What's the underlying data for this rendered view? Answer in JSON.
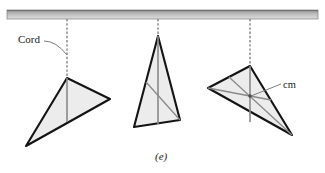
{
  "figure": {
    "caption": "(e)",
    "labels": {
      "cord": "Cord",
      "center_of_mass": "cm"
    },
    "colors": {
      "background": "#ffffff",
      "ceiling_fill_top": "#9d9d9d",
      "ceiling_fill_bottom": "#d8d8d8",
      "ceiling_edge": "#7a7a7a",
      "cord": "#8c8c8c",
      "plate_fill": "#ececec",
      "plate_edge": "#141414",
      "median_line": "#8a8a8a",
      "leader_line": "#6f6f6f",
      "text": "#1a1a1a"
    },
    "ceiling": {
      "name": "ceiling-bar",
      "x": 7,
      "y": 10,
      "width": 311,
      "height": 9
    },
    "cords": [
      {
        "name": "cord-1",
        "x": 67,
        "y_top": 19,
        "y_bottom": 79
      },
      {
        "name": "cord-2",
        "x": 158,
        "y_top": 19,
        "y_bottom": 37
      },
      {
        "name": "cord-3",
        "x": 250,
        "y_top": 19,
        "y_bottom": 67
      }
    ],
    "plates": [
      {
        "name": "triangular-plate-1",
        "pivot": [
          67,
          78
        ],
        "vertices": [
          [
            67,
            78
          ],
          [
            110,
            99
          ],
          [
            26,
            146
          ]
        ],
        "plumb_lines": [
          [
            [
              67,
              78
            ],
            [
              67,
              122
            ]
          ]
        ],
        "medians": []
      },
      {
        "name": "triangular-plate-2",
        "pivot": [
          158,
          36
        ],
        "vertices": [
          [
            158,
            36
          ],
          [
            180,
            120
          ],
          [
            134,
            127
          ]
        ],
        "plumb_lines": [
          [
            [
              158,
              36
            ],
            [
              158,
              124
            ]
          ]
        ],
        "medians": [
          [
            [
              180,
              120
            ],
            [
              146,
              82
            ]
          ]
        ]
      },
      {
        "name": "triangular-plate-3",
        "pivot": [
          250,
          66
        ],
        "vertices": [
          [
            250,
            66
          ],
          [
            292,
            135
          ],
          [
            208,
            88
          ]
        ],
        "plumb_lines": [
          [
            [
              250,
              66
            ],
            [
              250,
              122
            ]
          ]
        ],
        "medians": [
          [
            [
              292,
              135
            ],
            [
              229,
              77
            ]
          ],
          [
            [
              208,
              88
            ],
            [
              271,
              100
            ]
          ]
        ],
        "centroid": [
          250,
          96
        ]
      }
    ],
    "leaders": {
      "cord_leader": {
        "name": "cord-leader-line",
        "from": [
          44,
          41
        ],
        "to": [
          67,
          55
        ]
      },
      "cm_leader": {
        "name": "cm-leader-line",
        "from": [
          281,
          84
        ],
        "to": [
          251,
          96
        ]
      }
    }
  }
}
